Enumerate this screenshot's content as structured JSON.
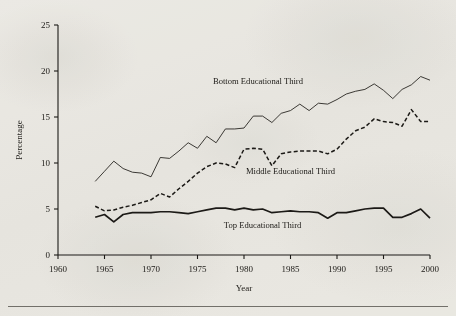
{
  "figure": {
    "background_color": "#f4f3f0",
    "ink_color": "#1d1b18",
    "footer_rule_color": "#5d5a55"
  },
  "chart_data": {
    "type": "line",
    "title": "",
    "xlabel": "Year",
    "ylabel": "Percentage",
    "xlim": [
      1960,
      2000
    ],
    "ylim": [
      0,
      25
    ],
    "xticks": [
      1960,
      1965,
      1970,
      1975,
      1980,
      1985,
      1990,
      1995,
      2000
    ],
    "xtick_labels": [
      "1960",
      "1965",
      "1970",
      "1975",
      "1980",
      "1985",
      "1990",
      "1995",
      "2000"
    ],
    "yticks": [
      0,
      5,
      10,
      15,
      20,
      25
    ],
    "ytick_labels": [
      "0",
      "5",
      "10",
      "15",
      "20",
      "25"
    ],
    "grid": false,
    "legend": "inline-annotations",
    "x": [
      1964,
      1965,
      1966,
      1967,
      1968,
      1969,
      1970,
      1971,
      1972,
      1973,
      1974,
      1975,
      1976,
      1977,
      1978,
      1979,
      1980,
      1981,
      1982,
      1983,
      1984,
      1985,
      1986,
      1987,
      1988,
      1989,
      1990,
      1991,
      1992,
      1993,
      1994,
      1995,
      1996,
      1997,
      1998,
      1999,
      2000
    ],
    "series": [
      {
        "name": "Bottom Educational Third",
        "style": "solid-thin",
        "color": "#1d1b18",
        "label_text": "Bottom Educational Third",
        "values": [
          8.0,
          9.1,
          10.2,
          9.4,
          9.0,
          8.9,
          8.5,
          10.6,
          10.5,
          11.3,
          12.2,
          11.6,
          12.9,
          12.2,
          13.7,
          13.7,
          13.8,
          15.1,
          15.1,
          14.4,
          15.4,
          15.7,
          16.4,
          15.7,
          16.5,
          16.4,
          16.9,
          17.5,
          17.8,
          18.0,
          18.6,
          17.9,
          17.0,
          18.0,
          18.5,
          19.4,
          19.0
        ]
      },
      {
        "name": "Middle Educational Third",
        "style": "dashed",
        "color": "#1d1b18",
        "label_text": "Middle Educational Third",
        "values": [
          5.3,
          4.8,
          4.9,
          5.2,
          5.4,
          5.7,
          6.0,
          6.7,
          6.3,
          7.2,
          8.0,
          8.9,
          9.6,
          10.0,
          9.9,
          9.5,
          11.5,
          11.6,
          11.5,
          9.7,
          11.0,
          11.2,
          11.3,
          11.3,
          11.3,
          11.0,
          11.5,
          12.6,
          13.5,
          13.9,
          14.8,
          14.5,
          14.4,
          14.0,
          15.8,
          14.5,
          14.5
        ]
      },
      {
        "name": "Top Educational Third",
        "style": "solid-bold",
        "color": "#1d1b18",
        "label_text": "Top Educational Third",
        "values": [
          4.1,
          4.4,
          3.6,
          4.4,
          4.6,
          4.6,
          4.6,
          4.7,
          4.7,
          4.6,
          4.5,
          4.7,
          4.9,
          5.1,
          5.1,
          4.9,
          5.1,
          4.9,
          5.0,
          4.6,
          4.7,
          4.8,
          4.7,
          4.7,
          4.6,
          4.0,
          4.6,
          4.6,
          4.8,
          5.0,
          5.1,
          5.1,
          4.1,
          4.1,
          4.5,
          5.0,
          4.0
        ]
      }
    ],
    "annotations": [
      {
        "text": "Bottom Educational Third",
        "x": 1981.5,
        "y": 18.6
      },
      {
        "text": "Middle Educational Third",
        "x": 1985.0,
        "y": 8.8
      },
      {
        "text": "Top Educational Third",
        "x": 1982.0,
        "y": 2.9
      }
    ]
  }
}
